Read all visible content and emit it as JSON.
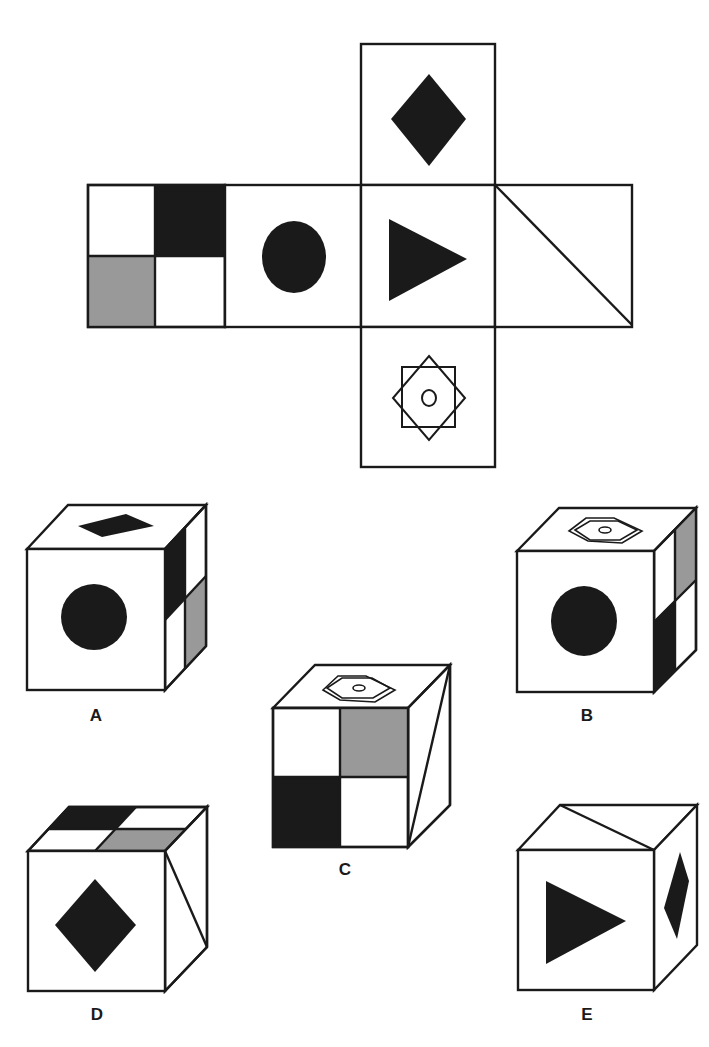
{
  "colors": {
    "ink": "#1a1a1a",
    "gray": "#999999",
    "paper": "#ffffff"
  },
  "net": {
    "faces": [
      {
        "id": "top",
        "symbol": "diamond-filled",
        "x": 361,
        "y": 44,
        "w": 134,
        "h": 141
      },
      {
        "id": "left-1",
        "symbol": "quad-checker",
        "quadrants": {
          "tl": "white",
          "tr": "black",
          "bl": "gray",
          "br": "white"
        },
        "x": 88,
        "y": 185,
        "w": 137,
        "h": 142
      },
      {
        "id": "left-2",
        "symbol": "circle-filled",
        "x": 225,
        "y": 185,
        "w": 136,
        "h": 142
      },
      {
        "id": "center",
        "symbol": "triangle-right-filled",
        "x": 361,
        "y": 185,
        "w": 134,
        "h": 142
      },
      {
        "id": "right",
        "symbol": "diagonal-line",
        "x": 495,
        "y": 185,
        "w": 137,
        "h": 142
      },
      {
        "id": "bottom",
        "symbol": "star-octagram-circle",
        "x": 361,
        "y": 327,
        "w": 134,
        "h": 140
      }
    ]
  },
  "options": [
    {
      "letter": "A",
      "front": "circle-filled",
      "top": "diamond-filled",
      "side": "quad-checker-side-black-gray"
    },
    {
      "letter": "B",
      "front": "circle-filled",
      "top": "star-octagram-circle",
      "side": "quad-checker-side-gray-black"
    },
    {
      "letter": "C",
      "front": "quad-checker",
      "top": "star-octagram-circle",
      "side": "diagonal-line"
    },
    {
      "letter": "D",
      "front": "diamond-filled",
      "top": "quad-checker",
      "side": "diagonal-line"
    },
    {
      "letter": "E",
      "front": "triangle-right-filled",
      "top": "diagonal-line",
      "side": "diamond-filled"
    }
  ]
}
